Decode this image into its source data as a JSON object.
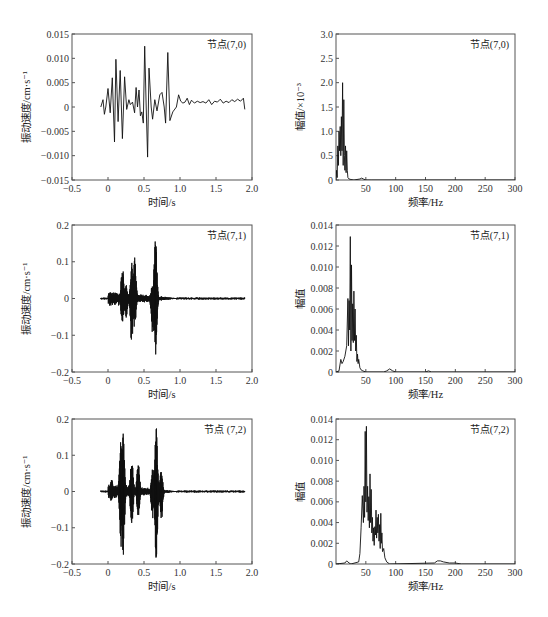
{
  "chart_data": [
    {
      "id": "time-7-0",
      "type": "line",
      "title": "",
      "annotation": "节点(7,0)",
      "xlabel": "时间/s",
      "ylabel": "振动速度/cm·s⁻¹",
      "xlim": [
        -0.5,
        2.0
      ],
      "ylim": [
        -0.015,
        0.015
      ],
      "xticks": [
        -0.5,
        0,
        0.5,
        1.0,
        1.5,
        2.0
      ],
      "xtick_labels": [
        "−0.5",
        "0",
        "0.5",
        "1.0",
        "1.5",
        "2.0"
      ],
      "yticks": [
        -0.015,
        -0.01,
        -0.005,
        0,
        0.005,
        0.01,
        0.015
      ],
      "ytick_labels": [
        "−0.015",
        "−0.010",
        "−0.005",
        "0",
        "0.005",
        "0.010",
        "0.015"
      ],
      "grid": false,
      "series": [
        {
          "name": "节点(7,0)",
          "x": [
            -0.1,
            -0.07,
            -0.05,
            -0.03,
            0,
            0.03,
            0.06,
            0.09,
            0.11,
            0.14,
            0.17,
            0.2,
            0.23,
            0.26,
            0.29,
            0.31,
            0.34,
            0.37,
            0.39,
            0.41,
            0.43,
            0.45,
            0.47,
            0.49,
            0.51,
            0.53,
            0.55,
            0.57,
            0.6,
            0.62,
            0.65,
            0.68,
            0.72,
            0.75,
            0.78,
            0.8,
            0.83,
            0.86,
            0.9,
            0.95,
            0.98,
            1.01,
            1.04,
            1.07,
            1.1,
            1.13,
            1.16,
            1.2,
            1.24,
            1.28,
            1.32,
            1.36,
            1.4,
            1.44,
            1.48,
            1.52,
            1.56,
            1.6,
            1.64,
            1.68,
            1.72,
            1.76,
            1.8,
            1.84,
            1.88,
            1.9
          ],
          "y": [
            0,
            0.0015,
            -0.0015,
            0,
            0.0038,
            -0.0012,
            0.006,
            -0.0072,
            0.0098,
            -0.003,
            0.0075,
            -0.0065,
            0.0062,
            -0.0005,
            0.0015,
            0.0005,
            0.001,
            -0.0012,
            0.004,
            0,
            0.0035,
            -0.0018,
            -0.001,
            -0.0033,
            0.0125,
            0,
            -0.0103,
            0.008,
            0,
            -0.0025,
            0.0015,
            -0.0008,
            0.0025,
            0.003,
            0,
            -0.0033,
            0.0112,
            -0.0028,
            -0.001,
            0,
            0.0025,
            0.0012,
            0.0008,
            0.001,
            0.0018,
            0.0005,
            0.0014,
            0.0008,
            0.0012,
            0.0009,
            0.0011,
            0.0008,
            0.0015,
            0.0005,
            0.0012,
            0.001,
            0.0016,
            0.0008,
            0.0012,
            0.0009,
            0.0015,
            0.0011,
            0.0016,
            0.0012,
            0.0018,
            -0.0005
          ]
        }
      ]
    },
    {
      "id": "spec-7-0",
      "type": "line",
      "title": "",
      "annotation": "节点(7,0)",
      "xlabel": "频率/Hz",
      "ylabel": "幅值/×10⁻³",
      "xlim": [
        0,
        300
      ],
      "ylim": [
        0,
        3.0
      ],
      "xticks": [
        50,
        100,
        150,
        200,
        250,
        300
      ],
      "xtick_labels": [
        "50",
        "100",
        "150",
        "200",
        "250",
        "300"
      ],
      "yticks": [
        0,
        0.5,
        1.0,
        1.5,
        2.0,
        2.5,
        3.0
      ],
      "ytick_labels": [
        "0",
        "0.5",
        "1.0",
        "1.5",
        "2.0",
        "2.5",
        "3.0"
      ],
      "grid": false,
      "series": [
        {
          "name": "节点(7,0)",
          "x": [
            0,
            1,
            2,
            3,
            4,
            5,
            6,
            7,
            8,
            9,
            10,
            11,
            12,
            13,
            14,
            15,
            16,
            17,
            18,
            19,
            20,
            22,
            25,
            30,
            40,
            43,
            46,
            50,
            60,
            100,
            150,
            200,
            250,
            300
          ],
          "y": [
            0,
            0.2,
            0.05,
            0.7,
            0.3,
            1.0,
            0.6,
            1.1,
            0.5,
            1.3,
            0.6,
            2.0,
            0.3,
            1.65,
            0.5,
            0.2,
            0.7,
            0.15,
            0.6,
            0.2,
            0.05,
            0.02,
            0.01,
            0.0,
            0.02,
            0.04,
            0.02,
            0.0,
            0.0,
            0.0,
            0.0,
            0.0,
            0.0,
            0.0
          ]
        }
      ]
    },
    {
      "id": "time-7-1",
      "type": "line",
      "title": "",
      "annotation": "节点(7,1)",
      "xlabel": "时间/s",
      "ylabel": "振动速度/cm·s⁻¹",
      "xlim": [
        -0.5,
        2.0
      ],
      "ylim": [
        -0.2,
        0.2
      ],
      "xticks": [
        -0.5,
        0,
        0.5,
        1.0,
        1.5,
        2.0
      ],
      "xtick_labels": [
        "−0.5",
        "0",
        "0.5",
        "1.0",
        "1.5",
        "2.0"
      ],
      "yticks": [
        -0.2,
        -0.1,
        0,
        0.1,
        0.2
      ],
      "ytick_labels": [
        "−0.2",
        "−0.1",
        "0",
        "0.1",
        "0.2"
      ],
      "grid": false,
      "series": [
        {
          "name": "节点(7,1)",
          "envelope_peaks": [
            {
              "t": 0.2,
              "max": 0.092,
              "min": -0.078
            },
            {
              "t": 0.25,
              "max": 0.04,
              "min": -0.06
            },
            {
              "t": 0.33,
              "max": 0.098,
              "min": -0.132
            },
            {
              "t": 0.37,
              "max": 0.12,
              "min": -0.082
            },
            {
              "t": 0.62,
              "max": 0.047,
              "min": -0.11
            },
            {
              "t": 0.66,
              "max": 0.175,
              "min": -0.158
            }
          ],
          "duration": [
            -0.1,
            1.9
          ]
        }
      ]
    },
    {
      "id": "spec-7-1",
      "type": "line",
      "title": "",
      "annotation": "节点(7,1)",
      "xlabel": "频率/Hz",
      "ylabel": "幅值",
      "xlim": [
        0,
        300
      ],
      "ylim": [
        0,
        0.014
      ],
      "xticks": [
        50,
        100,
        150,
        200,
        250,
        300
      ],
      "xtick_labels": [
        "50",
        "100",
        "150",
        "200",
        "250",
        "300"
      ],
      "yticks": [
        0,
        0.002,
        0.004,
        0.006,
        0.008,
        0.01,
        0.012,
        0.014
      ],
      "ytick_labels": [
        "0",
        "0.002",
        "0.004",
        "0.006",
        "0.008",
        "0.010",
        "0.012",
        "0.014"
      ],
      "grid": false,
      "series": [
        {
          "name": "节点(7,1)",
          "x": [
            0,
            5,
            8,
            10,
            12,
            15,
            18,
            20,
            21,
            22,
            23,
            24,
            25,
            26,
            27,
            28,
            29,
            30,
            31,
            32,
            33,
            34,
            35,
            36,
            37,
            38,
            40,
            42,
            45,
            50,
            80,
            85,
            90,
            95,
            100,
            150,
            155,
            160,
            200,
            300
          ],
          "y": [
            0,
            0.0001,
            0.0012,
            0.0008,
            0.001,
            0.0015,
            0.0025,
            0.007,
            0.0025,
            0.0068,
            0.004,
            0.0129,
            0.002,
            0.0102,
            0.003,
            0.0065,
            0.0028,
            0.0077,
            0.003,
            0.006,
            0.002,
            0.0035,
            0.001,
            0.0017,
            0.0008,
            0.0012,
            0.0004,
            0.0002,
            0.0001,
            0,
            0,
            0.0001,
            0.0003,
            0.0001,
            0,
            0,
            0.0001,
            0,
            0,
            0
          ]
        }
      ]
    },
    {
      "id": "time-7-2",
      "type": "line",
      "title": "",
      "annotation": "节点 (7,2)",
      "xlabel": "时间/s",
      "ylabel": "振动速度/cm·s⁻¹",
      "xlim": [
        -0.5,
        2.0
      ],
      "ylim": [
        -0.2,
        0.2
      ],
      "xticks": [
        -0.5,
        0,
        0.5,
        1.0,
        1.5,
        2.0
      ],
      "xtick_labels": [
        "−0.5",
        "0",
        "0.5",
        "1.0",
        "1.5",
        "2.0"
      ],
      "yticks": [
        -0.2,
        -0.1,
        0,
        0.1,
        0.2
      ],
      "ytick_labels": [
        "−0.2",
        "−0.1",
        "0",
        "0.1",
        "0.2"
      ],
      "grid": false,
      "series": [
        {
          "name": "节点(7,2)",
          "envelope_peaks": [
            {
              "t": 0.05,
              "max": 0.035,
              "min": -0.03
            },
            {
              "t": 0.18,
              "max": 0.155,
              "min": -0.155
            },
            {
              "t": 0.21,
              "max": 0.16,
              "min": -0.185
            },
            {
              "t": 0.33,
              "max": 0.1,
              "min": -0.1
            },
            {
              "t": 0.42,
              "max": 0.085,
              "min": -0.07
            },
            {
              "t": 0.62,
              "max": 0.07,
              "min": -0.08
            },
            {
              "t": 0.67,
              "max": 0.183,
              "min": -0.2
            },
            {
              "t": 0.74,
              "max": 0.06,
              "min": -0.09
            }
          ],
          "duration": [
            -0.1,
            1.9
          ]
        }
      ]
    },
    {
      "id": "spec-7-2",
      "type": "line",
      "title": "",
      "annotation": "节点(7,2)",
      "xlabel": "频率/Hz",
      "ylabel": "幅值",
      "xlim": [
        0,
        300
      ],
      "ylim": [
        0,
        0.014
      ],
      "xticks": [
        50,
        100,
        150,
        200,
        250,
        300
      ],
      "xtick_labels": [
        "50",
        "100",
        "150",
        "200",
        "250",
        "300"
      ],
      "yticks": [
        0,
        0.002,
        0.004,
        0.006,
        0.008,
        0.01,
        0.012,
        0.014
      ],
      "ytick_labels": [
        "0",
        "0.002",
        "0.004",
        "0.006",
        "0.008",
        "0.010",
        "0.012",
        "0.014"
      ],
      "grid": false,
      "series": [
        {
          "name": "节点(7,2)",
          "x": [
            0,
            15,
            18,
            20,
            22,
            25,
            38,
            40,
            42,
            44,
            46,
            47,
            48,
            49,
            50,
            51,
            52,
            53,
            54,
            55,
            56,
            57,
            58,
            59,
            60,
            61,
            62,
            63,
            64,
            65,
            66,
            67,
            68,
            69,
            70,
            71,
            72,
            73,
            74,
            75,
            76,
            77,
            78,
            80,
            82,
            85,
            90,
            165,
            170,
            175,
            180,
            190,
            200,
            210,
            300
          ],
          "y": [
            0,
            0.0001,
            0.0003,
            0.0002,
            0.0001,
            0,
            0.0002,
            0.001,
            0.0035,
            0.0066,
            0.004,
            0.0075,
            0.0045,
            0.0128,
            0.006,
            0.0133,
            0.005,
            0.0075,
            0.0042,
            0.0065,
            0.0035,
            0.0087,
            0.004,
            0.0072,
            0.003,
            0.0045,
            0.0022,
            0.0035,
            0.0018,
            0.0036,
            0.0028,
            0.0052,
            0.0025,
            0.0045,
            0.003,
            0.0048,
            0.0022,
            0.0038,
            0.0015,
            0.0049,
            0.002,
            0.003,
            0.0012,
            0.0015,
            0.0006,
            0.0002,
            0,
            0.0001,
            0.0003,
            0.0003,
            0.0002,
            0.0001,
            0.0001,
            0,
            0
          ]
        }
      ]
    }
  ]
}
